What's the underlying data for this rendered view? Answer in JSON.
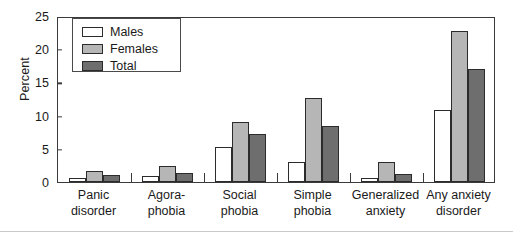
{
  "chart_data": {
    "type": "bar",
    "title": "",
    "xlabel": "",
    "ylabel": "Percent",
    "ylim": [
      0,
      25
    ],
    "ytick_values": [
      0,
      5,
      10,
      15,
      20,
      25
    ],
    "ytick_labels": [
      "0",
      "5",
      "10",
      "15",
      "20",
      "25"
    ],
    "grid": false,
    "legend_position": "upper left",
    "categories": [
      "Panic disorder",
      "Agora-phobia",
      "Social phobia",
      "Simple phobia",
      "Generalized anxiety",
      "Any anxiety disorder"
    ],
    "category_lines": [
      [
        "Panic",
        "disorder"
      ],
      [
        "Agora-",
        "phobia"
      ],
      [
        "Social",
        "phobia"
      ],
      [
        "Simple",
        "phobia"
      ],
      [
        "Generalized",
        "anxiety"
      ],
      [
        "Any anxiety",
        "disorder"
      ]
    ],
    "series": [
      {
        "name": "Males",
        "color": "#ffffff",
        "values": [
          0.6,
          0.9,
          5.2,
          3.0,
          0.6,
          10.9
        ]
      },
      {
        "name": "Females",
        "color": "#b6b6b6",
        "values": [
          1.6,
          2.4,
          9.1,
          12.6,
          3.0,
          22.7
        ]
      },
      {
        "name": "Total",
        "color": "#6e6e6e",
        "values": [
          1.1,
          1.4,
          7.3,
          8.4,
          1.2,
          17.0
        ]
      }
    ]
  },
  "legend": {
    "items": [
      {
        "label": "Males",
        "key": "males"
      },
      {
        "label": "Females",
        "key": "females"
      },
      {
        "label": "Total",
        "key": "total"
      }
    ]
  },
  "axis": {
    "y_title": "Percent"
  },
  "colors": {
    "males": "#ffffff",
    "females": "#b6b6b6",
    "total": "#6e6e6e",
    "axis": "#3a3a3a",
    "bar_outline": "#2b2b2b",
    "rule": "#c9c9c9"
  }
}
